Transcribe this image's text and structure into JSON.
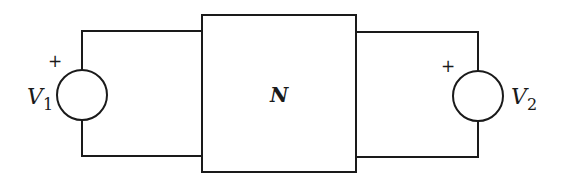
{
  "diagram": {
    "type": "two-port network circuit",
    "network": {
      "label": "N"
    },
    "left_source": {
      "label": "V",
      "subscript": "1",
      "polarity": "+"
    },
    "right_source": {
      "label": "V",
      "subscript": "2",
      "polarity": "+"
    },
    "colors": {
      "stroke": "#1a1a1a",
      "background": "#ffffff"
    }
  }
}
